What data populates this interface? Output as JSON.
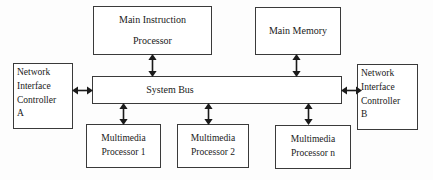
{
  "diagram": {
    "background_color": "#fdfdfd",
    "line_color": "#3a3a3a",
    "text_color": "#1a1a1a",
    "nodes": {
      "main_instruction_processor": {
        "line1": "Main Instruction",
        "line2": "Processor"
      },
      "main_memory": {
        "line1": "Main Memory"
      },
      "system_bus": {
        "line1": "System Bus"
      },
      "network_interface_controller_a": {
        "line1": "Network",
        "line2": "Interface",
        "line3": "Controller",
        "line4": "A"
      },
      "network_interface_controller_b": {
        "line1": "Network",
        "line2": "Interface",
        "line3": "Controller",
        "line4": "B"
      },
      "multimedia_processor_1": {
        "line1": "Multimedia",
        "line2": "Processor 1"
      },
      "multimedia_processor_2": {
        "line1": "Multimedia",
        "line2": "Processor 2"
      },
      "multimedia_processor_n": {
        "line1": "Multimedia",
        "line2": "Processor n"
      }
    },
    "connections": [
      {
        "name": "mip-to-bus",
        "from": "main_instruction_processor",
        "to": "system_bus",
        "style": "double-headed",
        "orientation": "vertical"
      },
      {
        "name": "memory-to-bus",
        "from": "main_memory",
        "to": "system_bus",
        "style": "double-headed",
        "orientation": "vertical"
      },
      {
        "name": "nic-a-to-bus",
        "from": "network_interface_controller_a",
        "to": "system_bus",
        "style": "double-headed",
        "orientation": "horizontal"
      },
      {
        "name": "bus-to-nic-b",
        "from": "system_bus",
        "to": "network_interface_controller_b",
        "style": "double-headed",
        "orientation": "horizontal"
      },
      {
        "name": "bus-to-mp1",
        "from": "system_bus",
        "to": "multimedia_processor_1",
        "style": "double-headed",
        "orientation": "vertical"
      },
      {
        "name": "bus-to-mp2",
        "from": "system_bus",
        "to": "multimedia_processor_2",
        "style": "double-headed",
        "orientation": "vertical"
      },
      {
        "name": "bus-to-mpn",
        "from": "system_bus",
        "to": "multimedia_processor_n",
        "style": "double-headed",
        "orientation": "vertical"
      }
    ]
  }
}
